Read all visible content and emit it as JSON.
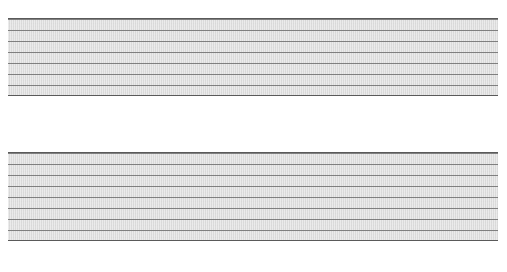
{
  "chart_data": {
    "type": "bar",
    "xlabel": "",
    "ylabel": "",
    "grid": true,
    "legend": "none",
    "categories": [
      "Amount of\nexercise",
      "Food",
      "Drinking",
      "Smoking",
      "Illegal\ndrugs",
      "Medication\ninstructions",
      "Unprotected\nsex"
    ],
    "series": [
      {
        "name": "Top panel",
        "orientation": "up",
        "values": [
          13,
          9,
          7,
          7,
          4,
          9,
          4
        ],
        "labels": [
          "13%",
          "9%",
          "7%",
          "7%",
          "4%",
          "9%",
          "4%"
        ],
        "ylim": [
          0,
          60
        ]
      },
      {
        "name": "Bottom panel",
        "orientation": "down",
        "values": [
          33,
          53,
          60,
          34,
          38,
          33,
          18
        ],
        "labels": [
          "33%",
          "53%",
          "60%",
          "34%",
          "38%",
          "33%",
          "18%"
        ],
        "ylim": [
          0,
          60
        ]
      }
    ]
  },
  "colors": {
    "panel_background": "#d9d9d9",
    "gridline": "#6e6e6e",
    "bar_dark": "#3c3c3c",
    "bar_light": "#fafafa",
    "bar_border": "#1d1d1d",
    "text": "#000000",
    "page_background": "#ffffff"
  }
}
